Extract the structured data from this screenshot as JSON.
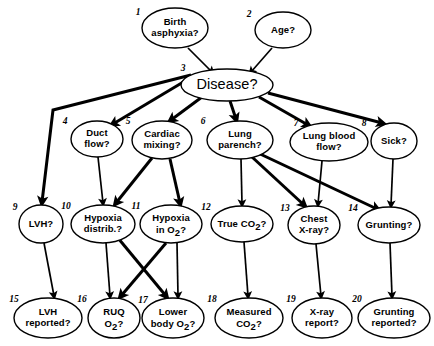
{
  "diagram": {
    "style": {
      "background": "#ffffff",
      "stroke": "#000000",
      "node_fill": "#ffffff"
    },
    "nodes": [
      {
        "id": "birth_asphyxia",
        "index": "1",
        "lines": [
          "Birth",
          "asphyxia?"
        ],
        "cx": 175,
        "cy": 28,
        "rx": 33,
        "ry": 20,
        "idx_x": 138,
        "idx_y": 15,
        "size": "small"
      },
      {
        "id": "age",
        "index": "2",
        "lines": [
          "Age?"
        ],
        "cx": 283,
        "cy": 30,
        "rx": 28,
        "ry": 18,
        "idx_x": 249,
        "idx_y": 17,
        "size": "small"
      },
      {
        "id": "disease",
        "index": "3",
        "lines": [
          "Disease?"
        ],
        "cx": 227,
        "cy": 85,
        "rx": 46,
        "ry": 16,
        "idx_x": 183,
        "idx_y": 71,
        "size": "big"
      },
      {
        "id": "duct_flow",
        "index": "4",
        "lines": [
          "Duct",
          "flow?"
        ],
        "cx": 97,
        "cy": 139,
        "rx": 26,
        "ry": 18,
        "idx_x": 65,
        "idx_y": 124,
        "size": "small"
      },
      {
        "id": "cardiac_mixing",
        "index": "5",
        "lines": [
          "Cardiac",
          "mixing?"
        ],
        "cx": 162,
        "cy": 140,
        "rx": 30,
        "ry": 19,
        "idx_x": 128,
        "idx_y": 124,
        "size": "small"
      },
      {
        "id": "lung_parench",
        "index": "6",
        "lines": [
          "Lung",
          "parench?"
        ],
        "cx": 240,
        "cy": 140,
        "rx": 33,
        "ry": 19,
        "idx_x": 203,
        "idx_y": 124,
        "size": "small"
      },
      {
        "id": "lung_blood_flow",
        "index": "7",
        "lines": [
          "Lung blood",
          "flow?"
        ],
        "cx": 329,
        "cy": 142,
        "rx": 39,
        "ry": 19,
        "idx_x": 296,
        "idx_y": 126,
        "size": "small"
      },
      {
        "id": "sick",
        "index": "8",
        "lines": [
          "Sick?"
        ],
        "cx": 394,
        "cy": 141,
        "rx": 23,
        "ry": 18,
        "idx_x": 364,
        "idx_y": 126,
        "size": "small"
      },
      {
        "id": "lvh",
        "index": "9",
        "lines": [
          "LVH?"
        ],
        "cx": 41,
        "cy": 224,
        "rx": 22,
        "ry": 19,
        "idx_x": 15,
        "idx_y": 210,
        "size": "small"
      },
      {
        "id": "hypoxia_distrib",
        "index": "10",
        "lines": [
          "Hypoxia",
          "distrib.?"
        ],
        "cx": 103,
        "cy": 224,
        "rx": 32,
        "ry": 19,
        "idx_x": 66,
        "idx_y": 209,
        "size": "small"
      },
      {
        "id": "hypoxia_in_o2",
        "index": "11",
        "lines": [
          "Hypoxia",
          "in O2?"
        ],
        "cx": 171,
        "cy": 224,
        "rx": 31,
        "ry": 19,
        "idx_x": 136,
        "idx_y": 209,
        "size": "small",
        "sub_line": 1
      },
      {
        "id": "true_co2",
        "index": "12",
        "lines": [
          "True CO2?"
        ],
        "cx": 242,
        "cy": 224,
        "rx": 31,
        "ry": 18,
        "idx_x": 206,
        "idx_y": 210,
        "size": "small",
        "sub_line": 0
      },
      {
        "id": "chest_xray",
        "index": "13",
        "lines": [
          "Chest",
          "X-ray?"
        ],
        "cx": 314,
        "cy": 225,
        "rx": 26,
        "ry": 19,
        "idx_x": 285,
        "idx_y": 211,
        "size": "small"
      },
      {
        "id": "grunting",
        "index": "14",
        "lines": [
          "Grunting?"
        ],
        "cx": 389,
        "cy": 225,
        "rx": 31,
        "ry": 18,
        "idx_x": 353,
        "idx_y": 211,
        "size": "small"
      },
      {
        "id": "lvh_reported",
        "index": "15",
        "lines": [
          "LVH",
          "reported?"
        ],
        "cx": 48,
        "cy": 318,
        "rx": 34,
        "ry": 20,
        "idx_x": 14,
        "idx_y": 302,
        "size": "small"
      },
      {
        "id": "ruq_o2",
        "index": "16",
        "lines": [
          "RUQ",
          "O2?"
        ],
        "cx": 114,
        "cy": 318,
        "rx": 26,
        "ry": 20,
        "idx_x": 82,
        "idx_y": 302,
        "size": "small",
        "sub_line": 1
      },
      {
        "id": "lower_body_o2",
        "index": "17",
        "lines": [
          "Lower",
          "body O2?"
        ],
        "cx": 173,
        "cy": 318,
        "rx": 31,
        "ry": 20,
        "idx_x": 143,
        "idx_y": 303,
        "size": "small",
        "sub_line": 1
      },
      {
        "id": "measured_co2",
        "index": "18",
        "lines": [
          "Measured",
          "CO2?"
        ],
        "cx": 249,
        "cy": 318,
        "rx": 34,
        "ry": 20,
        "idx_x": 212,
        "idx_y": 302,
        "size": "small",
        "sub_line": 1
      },
      {
        "id": "xray_report",
        "index": "19",
        "lines": [
          "X-ray",
          "report?"
        ],
        "cx": 322,
        "cy": 318,
        "rx": 30,
        "ry": 20,
        "idx_x": 291,
        "idx_y": 302,
        "size": "small"
      },
      {
        "id": "grunting_reported",
        "index": "20",
        "lines": [
          "Grunting",
          "reported?"
        ],
        "cx": 394,
        "cy": 318,
        "rx": 36,
        "ry": 20,
        "idx_x": 357,
        "idx_y": 302,
        "size": "small"
      }
    ],
    "edges": [
      {
        "from": "birth_asphyxia",
        "to": "disease",
        "weight": "thin",
        "points": [
          [
            188,
            48
          ],
          [
            212,
            72
          ]
        ]
      },
      {
        "from": "age",
        "to": "disease",
        "weight": "thin",
        "points": [
          [
            272,
            48
          ],
          [
            251,
            72
          ]
        ]
      },
      {
        "from": "disease",
        "to": "lvh",
        "weight": "thick",
        "points": [
          [
            191,
            75
          ],
          [
            53,
            110
          ],
          [
            42,
            202
          ]
        ]
      },
      {
        "from": "disease",
        "to": "duct_flow",
        "weight": "thick",
        "points": [
          [
            190,
            78
          ],
          [
            113,
            124
          ]
        ]
      },
      {
        "from": "disease",
        "to": "cardiac_mixing",
        "weight": "thick",
        "points": [
          [
            202,
            97
          ],
          [
            171,
            120
          ]
        ]
      },
      {
        "from": "disease",
        "to": "lung_parench",
        "weight": "thick",
        "points": [
          [
            230,
            101
          ],
          [
            236,
            119
          ]
        ]
      },
      {
        "from": "disease",
        "to": "lung_blood_flow",
        "weight": "thick",
        "points": [
          [
            259,
            97
          ],
          [
            308,
            125
          ]
        ]
      },
      {
        "from": "disease",
        "to": "sick",
        "weight": "thick",
        "points": [
          [
            268,
            93
          ],
          [
            382,
            123
          ]
        ]
      },
      {
        "from": "duct_flow",
        "to": "hypoxia_distrib",
        "weight": "thin",
        "points": [
          [
            98,
            157
          ],
          [
            103,
            203
          ]
        ]
      },
      {
        "from": "cardiac_mixing",
        "to": "hypoxia_distrib",
        "weight": "thick",
        "points": [
          [
            152,
            158
          ],
          [
            116,
            203
          ]
        ]
      },
      {
        "from": "cardiac_mixing",
        "to": "hypoxia_in_o2",
        "weight": "thick",
        "points": [
          [
            170,
            159
          ],
          [
            180,
            203
          ]
        ]
      },
      {
        "from": "lung_parench",
        "to": "true_co2",
        "weight": "thin",
        "points": [
          [
            241,
            159
          ],
          [
            242,
            204
          ]
        ]
      },
      {
        "from": "lung_parench",
        "to": "chest_xray",
        "weight": "thick",
        "points": [
          [
            252,
            157
          ],
          [
            304,
            205
          ]
        ]
      },
      {
        "from": "lung_parench",
        "to": "grunting",
        "weight": "thick",
        "points": [
          [
            258,
            153
          ],
          [
            377,
            209
          ]
        ]
      },
      {
        "from": "lung_blood_flow",
        "to": "chest_xray",
        "weight": "thin",
        "points": [
          [
            322,
            161
          ],
          [
            318,
            204
          ]
        ]
      },
      {
        "from": "sick",
        "to": "grunting",
        "weight": "thin",
        "points": [
          [
            393,
            159
          ],
          [
            391,
            205
          ]
        ]
      },
      {
        "from": "lvh",
        "to": "lvh_reported",
        "weight": "thin",
        "points": [
          [
            44,
            243
          ],
          [
            54,
            296
          ]
        ]
      },
      {
        "from": "hypoxia_distrib",
        "to": "ruq_o2",
        "weight": "thin",
        "points": [
          [
            106,
            243
          ],
          [
            110,
            296
          ]
        ]
      },
      {
        "from": "hypoxia_distrib",
        "to": "lower_body_o2",
        "weight": "thick",
        "points": [
          [
            118,
            238
          ],
          [
            166,
            296
          ]
        ]
      },
      {
        "from": "hypoxia_in_o2",
        "to": "ruq_o2",
        "weight": "thick",
        "points": [
          [
            166,
            243
          ],
          [
            121,
            296
          ]
        ]
      },
      {
        "from": "hypoxia_in_o2",
        "to": "lower_body_o2",
        "weight": "thin",
        "points": [
          [
            177,
            243
          ],
          [
            178,
            296
          ]
        ]
      },
      {
        "from": "true_co2",
        "to": "measured_co2",
        "weight": "thin",
        "points": [
          [
            244,
            242
          ],
          [
            248,
            296
          ]
        ]
      },
      {
        "from": "chest_xray",
        "to": "xray_report",
        "weight": "thin",
        "points": [
          [
            316,
            244
          ],
          [
            321,
            296
          ]
        ]
      },
      {
        "from": "grunting",
        "to": "grunting_reported",
        "weight": "thin",
        "points": [
          [
            390,
            243
          ],
          [
            392,
            296
          ]
        ]
      }
    ]
  }
}
